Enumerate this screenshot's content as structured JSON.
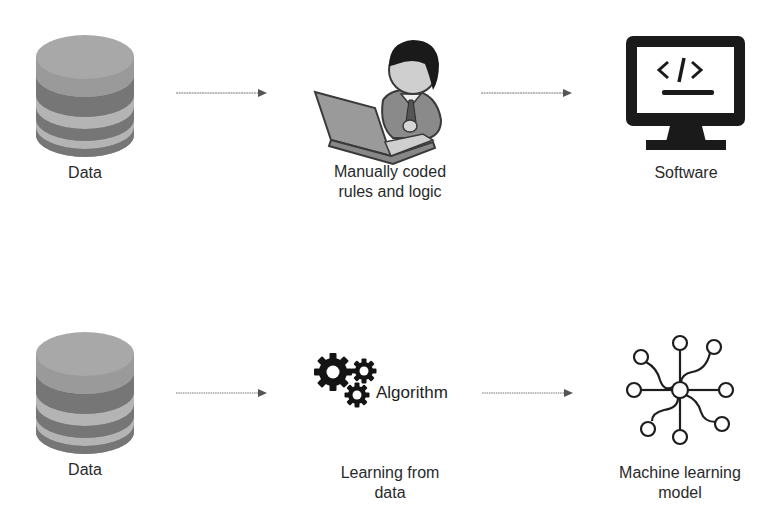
{
  "rows": [
    {
      "name": "traditional-programming",
      "nodes": [
        {
          "icon": "database-icon",
          "label": "Data"
        },
        {
          "icon": "programmer-at-laptop-icon",
          "label_line1": "Manually coded",
          "label_line2": "rules and logic"
        },
        {
          "icon": "computer-monitor-code-icon",
          "label": "Software"
        }
      ],
      "arrows": [
        {
          "from": 0,
          "to": 1
        },
        {
          "from": 1,
          "to": 2
        }
      ]
    },
    {
      "name": "machine-learning",
      "nodes": [
        {
          "icon": "database-icon",
          "label": "Data"
        },
        {
          "icon": "gears-icon",
          "inline_label": "Algorithm",
          "label_line1": "Learning from",
          "label_line2": "data"
        },
        {
          "icon": "neural-network-icon",
          "label_line1": "Machine learning",
          "label_line2": "model"
        }
      ],
      "arrows": [
        {
          "from": 0,
          "to": 1
        },
        {
          "from": 1,
          "to": 2
        }
      ]
    }
  ],
  "colors": {
    "db_light": "#9e9e9e",
    "db_dark": "#6e6e6e",
    "icon_black": "#1a1a1a",
    "arrow": "#6a6a6a"
  }
}
